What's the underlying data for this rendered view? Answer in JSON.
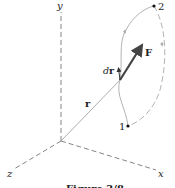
{
  "figure": {
    "caption": "Figure 3/8",
    "axes": {
      "x_label": "x",
      "y_label": "y",
      "z_label": "z"
    },
    "vectors": {
      "position_label": "r",
      "force_label": "F",
      "displacement_label_d": "d",
      "displacement_label_r": "r"
    },
    "points": {
      "start_label": "1",
      "end_label": "2"
    },
    "colors": {
      "axis": "#555555",
      "curve": "#aaaaaa",
      "force": "#444444",
      "text": "#222222"
    }
  }
}
